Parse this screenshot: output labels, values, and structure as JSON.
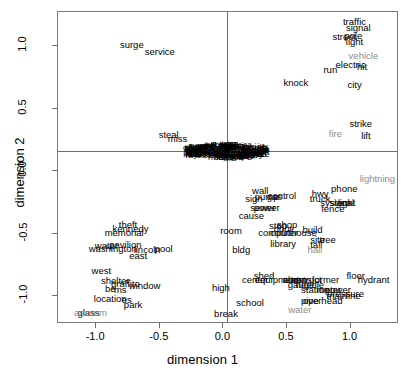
{
  "chart_data": {
    "type": "scatter",
    "title": "",
    "xlabel": "dimension 1",
    "ylabel": "dimension 2",
    "xlim": [
      -1.3,
      1.38
    ],
    "ylim": [
      -1.22,
      1.27
    ],
    "xticks": [
      "-1.0",
      "-0.5",
      "0.0",
      "0.5",
      "1.0"
    ],
    "xtick_values": [
      -1.0,
      -0.5,
      0.0,
      0.5,
      1.0
    ],
    "yticks": [
      "1.0",
      "0.5",
      "0.0",
      "-0.5",
      "-1.0"
    ],
    "ytick_values": [
      1.0,
      0.5,
      0.0,
      -0.5,
      -1.0
    ],
    "grid": false,
    "legend": "none",
    "reference_lines": {
      "vertical_x": 0.0,
      "horizontal_y": 0.0
    },
    "marker": "text-label",
    "colors": {
      "primary": "#000000",
      "secondary": "#8d8d8d",
      "axis": "#6f6f6f"
    },
    "points": [
      {
        "label": "surge",
        "x": -0.72,
        "y": 1.01,
        "color": "black"
      },
      {
        "label": "service",
        "x": -0.5,
        "y": 0.95,
        "color": "black"
      },
      {
        "label": "steal",
        "x": -0.43,
        "y": 0.29,
        "color": "black"
      },
      {
        "label": "miss",
        "x": -0.36,
        "y": 0.26,
        "color": "black"
      },
      {
        "label": "knock",
        "x": 0.57,
        "y": 0.7,
        "color": "black"
      },
      {
        "label": "run",
        "x": 0.84,
        "y": 0.81,
        "color": "black"
      },
      {
        "label": "city",
        "x": 1.03,
        "y": 0.69,
        "color": "black"
      },
      {
        "label": "traffic",
        "x": 1.03,
        "y": 1.19,
        "color": "black"
      },
      {
        "label": "signal",
        "x": 1.06,
        "y": 1.14,
        "color": "black"
      },
      {
        "label": "pole",
        "x": 1.02,
        "y": 1.08,
        "color": "black"
      },
      {
        "label": "street",
        "x": 0.95,
        "y": 1.07,
        "color": "black"
      },
      {
        "label": "light",
        "x": 1.03,
        "y": 1.03,
        "color": "black"
      },
      {
        "label": "vehicle",
        "x": 1.1,
        "y": 0.92,
        "color": "gray"
      },
      {
        "label": "electric",
        "x": 1.0,
        "y": 0.85,
        "color": "black"
      },
      {
        "label": "hit",
        "x": 1.09,
        "y": 0.83,
        "color": "black"
      },
      {
        "label": "strike",
        "x": 1.08,
        "y": 0.38,
        "color": "black"
      },
      {
        "label": "fire",
        "x": 0.88,
        "y": 0.3,
        "color": "gray"
      },
      {
        "label": "lift",
        "x": 1.12,
        "y": 0.28,
        "color": "black"
      },
      {
        "label": "lightning",
        "x": 1.21,
        "y": -0.06,
        "color": "gray"
      },
      {
        "label": "phone",
        "x": 0.95,
        "y": -0.14,
        "color": "black"
      },
      {
        "label": "wall",
        "x": 0.29,
        "y": -0.16,
        "color": "black"
      },
      {
        "label": "pump",
        "x": 0.34,
        "y": -0.21,
        "color": "black"
      },
      {
        "label": "gas",
        "x": 0.4,
        "y": -0.21,
        "color": "black"
      },
      {
        "label": "control",
        "x": 0.46,
        "y": -0.2,
        "color": "black"
      },
      {
        "label": "sign",
        "x": 0.24,
        "y": -0.22,
        "color": "black"
      },
      {
        "label": "hwy",
        "x": 0.76,
        "y": -0.18,
        "color": "black"
      },
      {
        "label": "truck",
        "x": 0.76,
        "y": -0.22,
        "color": "black"
      },
      {
        "label": "system",
        "x": 0.88,
        "y": -0.25,
        "color": "black"
      },
      {
        "label": "signal",
        "x": 0.93,
        "y": -0.25,
        "color": "black"
      },
      {
        "label": "light",
        "x": 0.97,
        "y": -0.25,
        "color": "black"
      },
      {
        "label": "sewer",
        "x": 0.31,
        "y": -0.29,
        "color": "black"
      },
      {
        "label": "power",
        "x": 0.34,
        "y": -0.29,
        "color": "black"
      },
      {
        "label": "fence",
        "x": 0.86,
        "y": -0.3,
        "color": "black"
      },
      {
        "label": "cause",
        "x": 0.22,
        "y": -0.36,
        "color": "black"
      },
      {
        "label": "stop",
        "x": 0.43,
        "y": -0.44,
        "color": "black"
      },
      {
        "label": "shop",
        "x": 0.5,
        "y": -0.43,
        "color": "black"
      },
      {
        "label": "door",
        "x": 0.47,
        "y": -0.46,
        "color": "black"
      },
      {
        "label": "room",
        "x": 0.06,
        "y": -0.48,
        "color": "black"
      },
      {
        "label": "computer",
        "x": 0.43,
        "y": -0.49,
        "color": "black"
      },
      {
        "label": "courthouse",
        "x": 0.55,
        "y": -0.49,
        "color": "black"
      },
      {
        "label": "build",
        "x": 0.7,
        "y": -0.47,
        "color": "black"
      },
      {
        "label": "site",
        "x": 0.74,
        "y": -0.55,
        "color": "black"
      },
      {
        "label": "tree",
        "x": 0.82,
        "y": -0.55,
        "color": "black"
      },
      {
        "label": "library",
        "x": 0.47,
        "y": -0.58,
        "color": "black"
      },
      {
        "label": "tall",
        "x": 0.73,
        "y": -0.59,
        "color": "black"
      },
      {
        "label": "hall",
        "x": 0.72,
        "y": -0.63,
        "color": "gray"
      },
      {
        "label": "bldg",
        "x": 0.14,
        "y": -0.63,
        "color": "black"
      },
      {
        "label": "pool",
        "x": -0.47,
        "y": -0.62,
        "color": "black"
      },
      {
        "label": "lincoln",
        "x": -0.6,
        "y": -0.63,
        "color": "black"
      },
      {
        "label": "pavilion",
        "x": -0.77,
        "y": -0.59,
        "color": "black"
      },
      {
        "label": "washington",
        "x": -0.87,
        "y": -0.62,
        "color": "black"
      },
      {
        "label": "water",
        "x": -0.92,
        "y": -0.6,
        "color": "black"
      },
      {
        "label": "east",
        "x": -0.67,
        "y": -0.68,
        "color": "black"
      },
      {
        "label": "theft",
        "x": -0.75,
        "y": -0.43,
        "color": "black"
      },
      {
        "label": "kennedy",
        "x": -0.73,
        "y": -0.46,
        "color": "black"
      },
      {
        "label": "memorial",
        "x": -0.78,
        "y": -0.49,
        "color": "black"
      },
      {
        "label": "west",
        "x": -0.96,
        "y": -0.8,
        "color": "black"
      },
      {
        "label": "shelter",
        "x": -0.85,
        "y": -0.88,
        "color": "black"
      },
      {
        "label": "graffito",
        "x": -0.77,
        "y": -0.9,
        "color": "black"
      },
      {
        "label": "be",
        "x": -0.89,
        "y": -0.94,
        "color": "black"
      },
      {
        "label": "ms",
        "x": -0.81,
        "y": -0.95,
        "color": "black"
      },
      {
        "label": "window",
        "x": -0.62,
        "y": -0.92,
        "color": "black"
      },
      {
        "label": "high",
        "x": -0.02,
        "y": -0.93,
        "color": "black"
      },
      {
        "label": "location",
        "x": -0.89,
        "y": -1.02,
        "color": "black"
      },
      {
        "label": "es",
        "x": -0.76,
        "y": -1.03,
        "color": "black"
      },
      {
        "label": "park",
        "x": -0.71,
        "y": -1.07,
        "color": "black"
      },
      {
        "label": "glass",
        "x": -1.06,
        "y": -1.13,
        "color": "black"
      },
      {
        "label": "art",
        "x": -1.13,
        "y": -1.13,
        "color": "gray"
      },
      {
        "label": "room",
        "x": -1.0,
        "y": -1.13,
        "color": "gray"
      },
      {
        "label": "break",
        "x": 0.02,
        "y": -1.14,
        "color": "black"
      },
      {
        "label": "school",
        "x": 0.21,
        "y": -1.05,
        "color": "black"
      },
      {
        "label": "center",
        "x": 0.25,
        "y": -0.87,
        "color": "black"
      },
      {
        "label": "shed",
        "x": 0.32,
        "y": -0.84,
        "color": "black"
      },
      {
        "label": "equipment",
        "x": 0.42,
        "y": -0.87,
        "color": "black"
      },
      {
        "label": "alarm",
        "x": 0.56,
        "y": -0.87,
        "color": "black"
      },
      {
        "label": "construct",
        "x": 0.62,
        "y": -0.87,
        "color": "black"
      },
      {
        "label": "transformer",
        "x": 0.72,
        "y": -0.87,
        "color": "black"
      },
      {
        "label": "floor",
        "x": 1.04,
        "y": -0.84,
        "color": "black"
      },
      {
        "label": "hydrant",
        "x": 1.18,
        "y": -0.87,
        "color": "black"
      },
      {
        "label": "needle",
        "x": 0.68,
        "y": -0.91,
        "color": "black"
      },
      {
        "label": "gauge",
        "x": 0.61,
        "y": -0.91,
        "color": "black"
      },
      {
        "label": "station",
        "x": 0.72,
        "y": -0.95,
        "color": "black"
      },
      {
        "label": "meter",
        "x": 0.83,
        "y": -0.95,
        "color": "black"
      },
      {
        "label": "power",
        "x": 0.9,
        "y": -0.95,
        "color": "black"
      },
      {
        "label": "pressure",
        "x": 0.96,
        "y": -0.98,
        "color": "black"
      },
      {
        "label": "main",
        "x": 0.89,
        "y": -1.0,
        "color": "black"
      },
      {
        "label": "line",
        "x": 1.02,
        "y": -1.0,
        "color": "black"
      },
      {
        "label": "pipe",
        "x": 0.68,
        "y": -1.04,
        "color": "black"
      },
      {
        "label": "overhead",
        "x": 0.78,
        "y": -1.04,
        "color": "black"
      },
      {
        "label": "water",
        "x": 0.6,
        "y": -1.11,
        "color": "gray"
      }
    ],
    "origin_cluster": {
      "description": "dense overlapping text labels at origin",
      "center": [
        0.0,
        0.0
      ],
      "approx_x_range": [
        -0.2,
        0.21
      ],
      "approx_y_range": [
        -0.05,
        0.04
      ],
      "visible_glyphs": [
        "c",
        "o",
        "d",
        "e",
        "a",
        "s",
        "n",
        "r",
        "t",
        "l",
        "m",
        "u",
        "g",
        "h",
        "i",
        "b",
        "p",
        "w",
        "f",
        "k",
        "v",
        "y",
        "j",
        "q",
        "x",
        "z",
        "on",
        "er",
        "in",
        "re",
        "ing",
        "ed",
        "st",
        "ar",
        "or",
        "an",
        "al",
        "ic",
        "es",
        "le",
        "nd",
        "ch",
        "th",
        "li",
        "ri",
        "ne",
        "te",
        "se",
        "ta",
        "tr",
        "co",
        "ca",
        "ma",
        "pa",
        "ra",
        "sa",
        "la",
        "da",
        "ba",
        "na",
        "ha",
        "ga",
        "ya",
        "va",
        "wa",
        "za",
        "ja",
        "ka",
        "qa",
        "fa",
        "ea"
      ]
    }
  }
}
